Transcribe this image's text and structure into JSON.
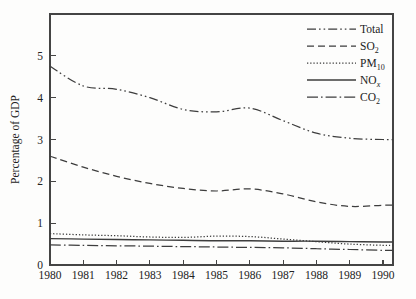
{
  "chart_data": {
    "type": "line",
    "title": "",
    "xlabel": "",
    "ylabel": "Percentage of GDP",
    "x": [
      1980,
      1981,
      1982,
      1983,
      1984,
      1985,
      1986,
      1987,
      1988,
      1989,
      1990
    ],
    "x_tick_labels": [
      "1980",
      "1981",
      "1982",
      "1983",
      "1984",
      "1985",
      "1986",
      "1987",
      "1988",
      "1989",
      "1990"
    ],
    "xlim": [
      1980,
      1990.3
    ],
    "ylim": [
      0,
      6
    ],
    "yticks": [
      0,
      1,
      2,
      3,
      4,
      5
    ],
    "grid": false,
    "legend_position": "top-right-inside",
    "line_color": "#3d3d3d",
    "axis_color": "#444444",
    "series": [
      {
        "name": "Total",
        "label_parts": [
          {
            "t": "Total"
          }
        ],
        "line_style": "dash-dot-dot",
        "dash": "9 3 1.6 3 1.6 3",
        "values": [
          4.75,
          4.28,
          4.2,
          4.0,
          3.72,
          3.66,
          3.75,
          3.45,
          3.15,
          3.03,
          3.0
        ]
      },
      {
        "name": "SO2",
        "label_parts": [
          {
            "t": "SO"
          },
          {
            "t": "2",
            "sub": true
          }
        ],
        "line_style": "dashed",
        "dash": "7 4",
        "values": [
          2.6,
          2.34,
          2.12,
          1.95,
          1.83,
          1.77,
          1.82,
          1.7,
          1.51,
          1.4,
          1.43
        ]
      },
      {
        "name": "PM10",
        "label_parts": [
          {
            "t": "PM"
          },
          {
            "t": "10",
            "sub": true
          }
        ],
        "line_style": "dotted",
        "dash": "1.3 1.9",
        "values": [
          0.75,
          0.72,
          0.7,
          0.67,
          0.66,
          0.69,
          0.68,
          0.62,
          0.56,
          0.5,
          0.47
        ]
      },
      {
        "name": "NOx",
        "label_parts": [
          {
            "t": "NO"
          },
          {
            "t": "x",
            "sub": true,
            "italic": true
          }
        ],
        "line_style": "solid",
        "dash": "",
        "values": [
          0.63,
          0.62,
          0.61,
          0.6,
          0.59,
          0.58,
          0.58,
          0.57,
          0.57,
          0.56,
          0.55
        ]
      },
      {
        "name": "CO2",
        "label_parts": [
          {
            "t": "CO"
          },
          {
            "t": "2",
            "sub": true
          }
        ],
        "line_style": "dash-dot",
        "dash": "11 3 1.6 3",
        "values": [
          0.48,
          0.47,
          0.46,
          0.45,
          0.44,
          0.43,
          0.42,
          0.41,
          0.39,
          0.37,
          0.35
        ]
      }
    ]
  }
}
